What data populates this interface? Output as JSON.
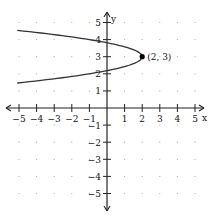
{
  "chart_data": {
    "type": "line",
    "title": "",
    "xlabel": "x",
    "ylabel": "y",
    "xlim": [
      -5,
      5
    ],
    "ylim": [
      -5,
      5
    ],
    "grid": "dots",
    "x_ticks": [
      -5,
      -4,
      -3,
      -2,
      -1,
      1,
      2,
      3,
      4,
      5
    ],
    "y_ticks": [
      -5,
      -4,
      -3,
      -2,
      -1,
      1,
      2,
      3,
      4,
      5
    ],
    "series": [
      {
        "name": "parabola",
        "equation": "x = -3(y - 3)^2 + 2",
        "vertex": [
          2,
          3
        ],
        "opens": "left",
        "points": [
          [
            -5.1,
            4.54
          ],
          [
            -3,
            4.29
          ],
          [
            -1,
            4
          ],
          [
            0,
            3.82
          ],
          [
            1,
            3.58
          ],
          [
            2,
            3
          ],
          [
            1,
            2.42
          ],
          [
            0,
            2.18
          ],
          [
            -1,
            2
          ],
          [
            -3,
            1.71
          ],
          [
            -5.1,
            1.46
          ]
        ]
      }
    ],
    "annotations": [
      {
        "label": "(2, 3)",
        "x": 2,
        "y": 3,
        "marker": "filled-dot"
      }
    ]
  },
  "axes": {
    "x_label": "x",
    "y_label": "y"
  },
  "annotation_label": "(2, 3)"
}
